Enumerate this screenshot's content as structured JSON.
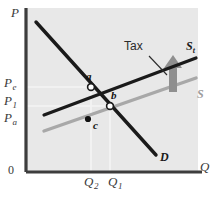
{
  "figure": {
    "background": "#ffffff",
    "plot_background": "#e8e8e8"
  },
  "axes": {
    "y_axis_label": "P",
    "x_axis_label": "Q",
    "origin_label": "0",
    "axis_color": "#2b2b2b",
    "y_ticks": [
      {
        "id": "Pe",
        "base": "P",
        "sub": "e",
        "label": "Pe",
        "y_px": 84
      },
      {
        "id": "P1",
        "base": "P",
        "sub": "1",
        "label": "P1",
        "y_px": 102
      },
      {
        "id": "Pa",
        "base": "P",
        "sub": "a",
        "label": "Pa",
        "y_px": 119
      }
    ],
    "x_ticks": [
      {
        "id": "Q2",
        "base": "Q",
        "sub": "2",
        "label": "Q2",
        "x_px": 91
      },
      {
        "id": "Q1",
        "base": "Q",
        "sub": "1",
        "label": "Q1",
        "x_px": 114
      }
    ]
  },
  "curves": [
    {
      "name": "supply-with-tax",
      "label": "S",
      "label_sub": "t",
      "color": "#1a1a1a",
      "width": 3.2,
      "from": [
        44,
        115
      ],
      "to": [
        196,
        58
      ]
    },
    {
      "name": "supply",
      "label": "S",
      "label_sub": "",
      "color": "#a8a8a8",
      "width": 3.2,
      "from": [
        44,
        131
      ],
      "to": [
        196,
        78
      ]
    },
    {
      "name": "demand",
      "label": "D",
      "label_sub": "",
      "color": "#1a1a1a",
      "width": 3.4,
      "from": [
        36,
        22
      ],
      "to": [
        156,
        155
      ]
    }
  ],
  "points": [
    {
      "name": "a",
      "label": "a",
      "x": 91,
      "y": 87,
      "style": "hollow",
      "label_dx": -4,
      "label_dy": -14
    },
    {
      "name": "b",
      "label": "b",
      "x": 110,
      "y": 106,
      "style": "hollow",
      "label_dx": 2,
      "label_dy": -14
    },
    {
      "name": "c",
      "label": "c",
      "x": 88,
      "y": 119,
      "style": "solid",
      "label_dx": 3,
      "label_dy": 3
    }
  ],
  "annotations": {
    "tax": {
      "label": "Tax",
      "text_x": 126,
      "text_y": 46,
      "leader_from": [
        150,
        57
      ],
      "leader_to": [
        166,
        74
      ]
    },
    "shift_arrow": {
      "name": "upward-shift-arrow",
      "color": "#8c8c8c",
      "x": 173,
      "y_top": 58,
      "y_bottom": 92
    }
  },
  "guides": {
    "color": "#f2f2f2",
    "lines": [
      {
        "from": [
          26,
          87
        ],
        "to": [
          91,
          87
        ]
      },
      {
        "from": [
          26,
          106
        ],
        "to": [
          110,
          106
        ]
      },
      {
        "from": [
          91,
          87
        ],
        "to": [
          91,
          172
        ]
      },
      {
        "from": [
          110,
          106
        ],
        "to": [
          110,
          172
        ]
      }
    ]
  }
}
